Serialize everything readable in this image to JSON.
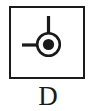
{
  "figure": {
    "caption": "D",
    "symbol_name": "datum-target-point-symbol",
    "border_color": "#1a1a1a",
    "line_color": "#1a1a1a",
    "fill_color": "#1a1a1a",
    "background_color": "#ffffff",
    "elements": {
      "outer_square": "square-frame",
      "circle": "outer-circle",
      "center_dot": "filled-center-dot",
      "vertical_leader": "vertical-leader-line",
      "horizontal_leader": "horizontal-leader-line"
    }
  }
}
